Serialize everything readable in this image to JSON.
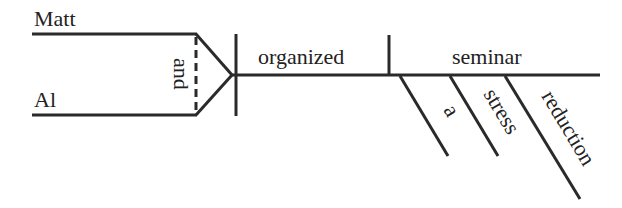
{
  "diagram": {
    "type": "sentence-diagram (Reed-Kellogg)",
    "sentence_parts": {
      "subjects": [
        "Matt",
        "Al"
      ],
      "conjunction": "and",
      "verb": "organized",
      "direct_object": "seminar",
      "modifiers": [
        "a",
        "stress",
        "reduction"
      ]
    },
    "labels": {
      "subject1": "Matt",
      "subject2": "Al",
      "conjunction": "and",
      "verb": "organized",
      "object": "seminar",
      "mod1": "a",
      "mod2": "stress",
      "mod3": "reduction"
    },
    "colors": {
      "line": "#2a2a2a",
      "text": "#222222",
      "background": "#ffffff"
    }
  }
}
